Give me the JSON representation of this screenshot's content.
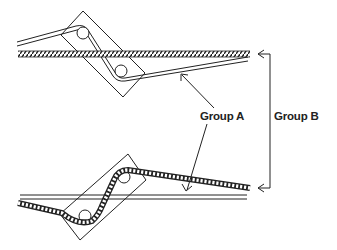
{
  "diagram": {
    "labels": {
      "group_a": "Group A",
      "group_b": "Group B"
    },
    "colors": {
      "line": "#222222",
      "background": "#ffffff"
    },
    "components": [
      {
        "name": "top-clamp-block",
        "type": "rotated-rectangle"
      },
      {
        "name": "top-rope-strand",
        "type": "twisted-rope",
        "group": "B"
      },
      {
        "name": "top-wire-double-line",
        "type": "double-line",
        "group": "A"
      },
      {
        "name": "bottom-clamp-block",
        "type": "rotated-rectangle"
      },
      {
        "name": "bottom-rope-strand",
        "type": "twisted-rope",
        "group": "B"
      },
      {
        "name": "bottom-wire-double-line",
        "type": "double-line",
        "group": "A"
      }
    ]
  }
}
